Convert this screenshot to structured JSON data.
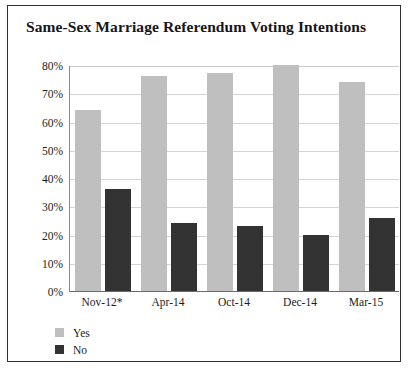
{
  "chart_data": {
    "type": "bar",
    "title": "Same-Sex Marriage Referendum Voting Intentions",
    "xlabel": "",
    "ylabel": "",
    "categories": [
      "Nov-12*",
      "Apr-14",
      "Oct-14",
      "Dec-14",
      "Mar-15"
    ],
    "series": [
      {
        "name": "Yes",
        "color": "#bfbfbf",
        "values": [
          64,
          76,
          77,
          80,
          74
        ]
      },
      {
        "name": "No",
        "color": "#333333",
        "values": [
          36,
          24,
          23,
          20,
          26
        ]
      }
    ],
    "ylim": [
      0,
      80
    ],
    "ytick_step": 10,
    "ytick_labels": [
      "80%",
      "70%",
      "60%",
      "50%",
      "40%",
      "30%",
      "20%",
      "10%",
      "0%"
    ],
    "ytick_values": [
      80,
      70,
      60,
      50,
      40,
      30,
      20,
      10,
      0
    ],
    "grid": true,
    "grid_axis": "y",
    "legend_position": "bottom-left",
    "value_suffix": "%",
    "footnote_marker": "*"
  },
  "legend": {
    "items": [
      {
        "label": "Yes"
      },
      {
        "label": "No"
      }
    ]
  },
  "colors": {
    "yes": "#bfbfbf",
    "no": "#333333",
    "grid": "#d4d4d4",
    "axis": "#6b6b6b",
    "border": "#2e2e33",
    "text": "#1c1c20",
    "background": "#ffffff"
  }
}
